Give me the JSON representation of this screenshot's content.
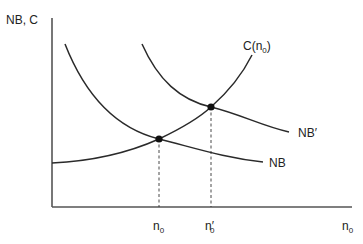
{
  "diagram": {
    "type": "economics-curve-diagram",
    "y_axis_label": "NB, C",
    "x_axis_label": {
      "base": "n",
      "sub": "0"
    },
    "curves": [
      {
        "name": "NB",
        "label": "NB",
        "shape": "downward-sloping convex"
      },
      {
        "name": "NB-prime",
        "label": "NB′",
        "shape": "downward-sloping convex, shifted right"
      },
      {
        "name": "cost",
        "label": {
          "base": "C(n",
          "sub": "0",
          "close": ")"
        },
        "shape": "upward-sloping convex"
      }
    ],
    "equilibria": [
      {
        "name": "original",
        "x_label": {
          "base": "n",
          "sub": "0"
        }
      },
      {
        "name": "new",
        "x_label": {
          "base": "n′",
          "sub": "0"
        }
      }
    ],
    "colors": {
      "line": "#2a2a2a",
      "axis": "#555555",
      "text": "#222222"
    }
  }
}
